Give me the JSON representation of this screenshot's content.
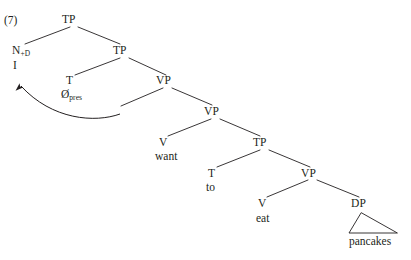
{
  "figure": {
    "example_number": "(7)",
    "sentence": "I want to eat pancakes",
    "text_color": "#231f20",
    "background_color": "#ffffff"
  },
  "tree": {
    "nodes": {
      "root_tp": {
        "label": "TP",
        "x": 72,
        "y": 22
      },
      "subject_n": {
        "label": "N",
        "subscript": "+D",
        "x": 18,
        "y": 53
      },
      "inner_tp": {
        "label": "TP",
        "x": 122,
        "y": 53
      },
      "t_pres": {
        "label": "T",
        "x": 70,
        "y": 83
      },
      "upper_vp": {
        "label": "VP",
        "x": 165,
        "y": 83
      },
      "lower_vp": {
        "label": "VP",
        "x": 213,
        "y": 114
      },
      "v_want": {
        "label": "V",
        "x": 163,
        "y": 145
      },
      "want_tp": {
        "label": "TP",
        "x": 262,
        "y": 145
      },
      "t_to": {
        "label": "T",
        "x": 212,
        "y": 175
      },
      "inner_vp": {
        "label": "VP",
        "x": 310,
        "y": 175
      },
      "v_eat": {
        "label": "V",
        "x": 262,
        "y": 206
      },
      "dp_object": {
        "label": "DP",
        "x": 360,
        "y": 206
      }
    },
    "terminals": {
      "subject": {
        "text": "I",
        "x": 18,
        "y": 66
      },
      "tense_present": {
        "text": "Ø",
        "subscript": "pres",
        "x": 62,
        "y": 96
      },
      "want": {
        "text": "want",
        "x": 159,
        "y": 158
      },
      "to": {
        "text": "to",
        "x": 208,
        "y": 188
      },
      "eat": {
        "text": "eat",
        "x": 257,
        "y": 219
      },
      "pancakes": {
        "text": "pancakes",
        "x": 352,
        "y": 243
      }
    },
    "movement_arrow": {
      "description": "subject-raising-arrow",
      "from_label": "VP-internal subject trace",
      "to_label": "I"
    },
    "triangle": {
      "description": "dp-abbreviation-triangle",
      "under_node": "DP",
      "covers": "pancakes"
    }
  }
}
